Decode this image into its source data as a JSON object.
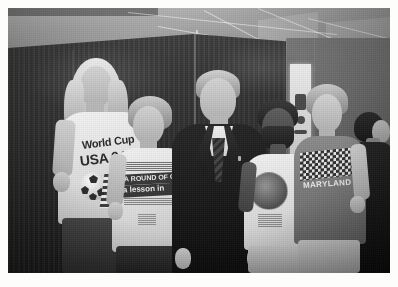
{
  "image": {
    "kind": "photograph",
    "medium": "black-and-white photographic print",
    "caption": "Five men posing together indoors in front of a dark curtain backdrop",
    "border_color": "#ffffff",
    "tone": "grayscale"
  },
  "scene": {
    "setting": "indoor venue with dark draped backdrop and exposed lit ceiling",
    "background_elements": [
      "dark pleated curtain or drape panel",
      "bright industrial ceiling with beams and panels",
      "light-colored wall at right",
      "narrow lit doorway or panel at right with wall-mounted device",
      "concrete floor strip at lower right"
    ]
  },
  "subjects": [
    {
      "id": "man-long-hair",
      "position": "far left",
      "hair": "long blond hair past shoulders",
      "facial_hair": "light stubble",
      "expression": "smiling",
      "clothing": "white short-sleeve t-shirt, dark jeans",
      "shirt_graphic": {
        "line1": "World Cup",
        "line2": "USA 94",
        "artwork": "soccer ball with striped flag motif"
      }
    },
    {
      "id": "man-curly-light",
      "position": "left of center",
      "hair": "short wavy light brown hair",
      "expression": "smiling",
      "clothing": "white short-sleeve t-shirt, dark trousers",
      "shirt_graphic": {
        "line1": "A ROUND OF GOLF",
        "line2": "a lesson in",
        "style": "reversed text in dark bands with small print above and below"
      }
    },
    {
      "id": "man-center-suit",
      "position": "center",
      "hair": "short light gray hair",
      "expression": "smiling",
      "clothing": "dark business suit, white dress shirt, patterned dark necktie",
      "accessory": "small lapel pin"
    },
    {
      "id": "man-bearded",
      "position": "right of center",
      "hair": "short dark hair",
      "facial_hair": "full dark beard and moustache",
      "clothing": "white short-sleeve t-shirt, light khaki trousers",
      "shirt_graphic": {
        "artwork": "round dark circular emblem with text",
        "pose": "arm around the shoulder of the man to his right"
      }
    },
    {
      "id": "man-curly-right",
      "position": "far right",
      "hair": "curly light brown hair",
      "expression": "smiling",
      "clothing": "gray t-shirt, light trousers, hand in pocket",
      "shirt_graphic": {
        "line1": "MARYLAND",
        "artwork": "checkered flag pattern"
      }
    },
    {
      "id": "person-background",
      "position": "far right edge, background",
      "description": "partially visible person in dark clothing facing away",
      "hair": "dark hair"
    }
  ],
  "composition": {
    "subject_count": 5,
    "framing": "waist-up group portrait",
    "orientation": "landscape",
    "white_border_px": 8
  },
  "colors": {
    "paper": "#ffffff",
    "shadow": "#1b1b1e",
    "midtone": "#7a7770",
    "highlight": "#f3f1ea"
  }
}
